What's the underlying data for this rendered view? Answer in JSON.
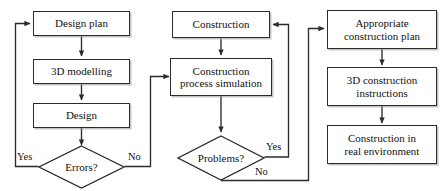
{
  "diagram": {
    "type": "flowchart",
    "title": "",
    "background_color": "#ffffff",
    "line_color": "#2b2b2b",
    "text_color": "#111111",
    "columns": [
      {
        "name": "design-column",
        "nodes": [
          {
            "id": "design-plan",
            "shape": "rectangle",
            "label": "Design plan"
          },
          {
            "id": "3d-modelling",
            "shape": "rectangle",
            "label": "3D modelling"
          },
          {
            "id": "design",
            "shape": "rectangle",
            "label": "Design"
          },
          {
            "id": "errors-decision",
            "shape": "diamond",
            "label": "Errors?"
          }
        ]
      },
      {
        "name": "simulation-column",
        "nodes": [
          {
            "id": "construction",
            "shape": "rectangle",
            "label": "Construction"
          },
          {
            "id": "construction-process-simulation",
            "shape": "rectangle",
            "label_line1": "Construction",
            "label_line2": "process simulation"
          },
          {
            "id": "problems-decision",
            "shape": "diamond",
            "label": "Problems?"
          }
        ]
      },
      {
        "name": "execution-column",
        "nodes": [
          {
            "id": "appropriate-construction-plan",
            "shape": "rectangle",
            "label_line1": "Appropriate",
            "label_line2": "construction plan"
          },
          {
            "id": "3d-construction-instructions",
            "shape": "rectangle",
            "label_line1": "3D construction",
            "label_line2": "instructions"
          },
          {
            "id": "construction-in-real-environment",
            "shape": "rectangle",
            "label_line1": "Construction in",
            "label_line2": "real environment"
          }
        ]
      }
    ],
    "nodes": {
      "design_plan": "Design plan",
      "three_d_modelling": "3D modelling",
      "design": "Design",
      "errors": "Errors?",
      "construction": "Construction",
      "construction_simulation_line1": "Construction",
      "construction_simulation_line2": "process simulation",
      "problems": "Problems?",
      "appropriate_plan_line1": "Appropriate",
      "appropriate_plan_line2": "construction plan",
      "three_d_instructions_line1": "3D construction",
      "three_d_instructions_line2": "instructions",
      "real_construction_line1": "Construction in",
      "real_construction_line2": "real environment"
    },
    "edge_labels": {
      "errors_yes": "Yes",
      "errors_no": "No",
      "problems_yes": "Yes",
      "problems_no": "No"
    },
    "edges": [
      {
        "from": "design-plan",
        "to": "3d-modelling",
        "label": ""
      },
      {
        "from": "3d-modelling",
        "to": "design",
        "label": ""
      },
      {
        "from": "design",
        "to": "errors-decision",
        "label": ""
      },
      {
        "from": "errors-decision",
        "to": "design-plan",
        "label": "Yes"
      },
      {
        "from": "errors-decision",
        "to": "construction-process-simulation",
        "label": "No"
      },
      {
        "from": "construction",
        "to": "construction-process-simulation",
        "label": ""
      },
      {
        "from": "construction-process-simulation",
        "to": "problems-decision",
        "label": ""
      },
      {
        "from": "problems-decision",
        "to": "construction",
        "label": "Yes"
      },
      {
        "from": "problems-decision",
        "to": "appropriate-construction-plan",
        "label": "No"
      },
      {
        "from": "appropriate-construction-plan",
        "to": "3d-construction-instructions",
        "label": ""
      },
      {
        "from": "3d-construction-instructions",
        "to": "construction-in-real-environment",
        "label": ""
      }
    ]
  }
}
